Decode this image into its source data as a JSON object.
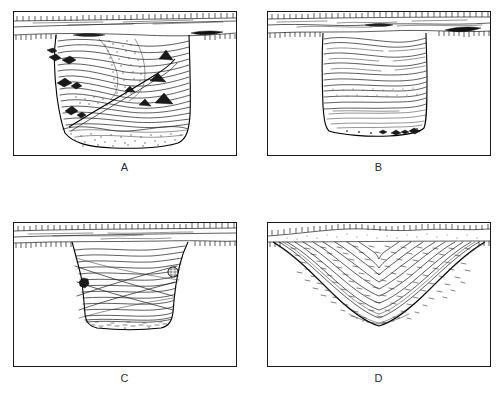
{
  "figure": {
    "panel_count": 4,
    "background_color": "#ffffff",
    "ink_color": "#1a1a1a"
  },
  "panels": [
    {
      "id": "A",
      "label": "A",
      "description": "Deep steep-sided pit with many wavy fill layers, scattered stones and stippled basal fill",
      "frame": {
        "x": 13,
        "y": 11,
        "w": 223,
        "h": 144
      },
      "topsoil": {
        "top_hachures": true,
        "subsoil_hachures": true,
        "band_height": 22
      },
      "cut": {
        "left_x": 43,
        "right_x": 190,
        "base_y": 135,
        "shape": "steep-sided-flat-base"
      },
      "features": [
        "wavy-fill-lines",
        "stone-symbols",
        "stipple-basal-layer",
        "diagonal-cut-line",
        "dark-topsoil-lens"
      ]
    },
    {
      "id": "B",
      "label": "B",
      "description": "Narrow vertical-sided pit with horizontal stratified fill and stones at base",
      "frame": {
        "x": 267,
        "y": 11,
        "w": 223,
        "h": 144
      },
      "topsoil": {
        "top_hachures": true,
        "subsoil_hachures": true,
        "band_height": 22
      },
      "cut": {
        "left_x": 323,
        "right_x": 437,
        "base_y": 130,
        "shape": "vertical-sided-flat-base"
      },
      "features": [
        "horizontal-fill-lines",
        "banded-laminated-zone",
        "basal-stones",
        "dark-topsoil-lens"
      ]
    },
    {
      "id": "C",
      "label": "C",
      "description": "Shallower wide pit with cross-cutting fill lines and two dark artifacts on the sides",
      "frame": {
        "x": 13,
        "y": 222,
        "w": 223,
        "h": 144
      },
      "topsoil": {
        "top_hachures": true,
        "subsoil_hachures": true,
        "band_height": 20
      },
      "cut": {
        "left_x": 72,
        "right_x": 188,
        "base_y": 320,
        "shape": "bowl-sided-flat-base"
      },
      "features": [
        "cross-cutting-lines",
        "dark-artifact-left",
        "round-hatched-artifact-right",
        "basal-dash-layer"
      ]
    },
    {
      "id": "D",
      "label": "D",
      "description": "Broad shallow bowl-shaped hollow with concentric arc fill and dense dash texture",
      "frame": {
        "x": 267,
        "y": 222,
        "w": 223,
        "h": 144
      },
      "topsoil": {
        "top_hachures": true,
        "subsoil_hachures": true,
        "band_height": 18
      },
      "cut": {
        "left_x": 272,
        "right_x": 485,
        "base_y": 330,
        "shape": "broad-bowl"
      },
      "features": [
        "concentric-arc-fill",
        "dense-dash-texture",
        "undulating-ground-surface"
      ]
    }
  ]
}
